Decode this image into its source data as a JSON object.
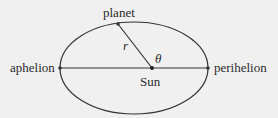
{
  "diagram": {
    "colors": {
      "background": "#f0f0f0",
      "line": "#333333",
      "text": "#2a2a2a"
    },
    "ellipse": {
      "cx": 134,
      "cy": 68,
      "rx": 74,
      "ry": 46
    },
    "points": {
      "sun": {
        "x": 152,
        "y": 68
      },
      "planet": {
        "x": 118,
        "y": 24
      },
      "aphelion": {
        "x": 60,
        "y": 68
      },
      "perihelion": {
        "x": 208,
        "y": 68
      }
    },
    "labels": {
      "planet": "planet",
      "sun": "Sun",
      "aphelion": "aphelion",
      "perihelion": "perihelion",
      "radius": "r",
      "angle": "θ"
    }
  }
}
